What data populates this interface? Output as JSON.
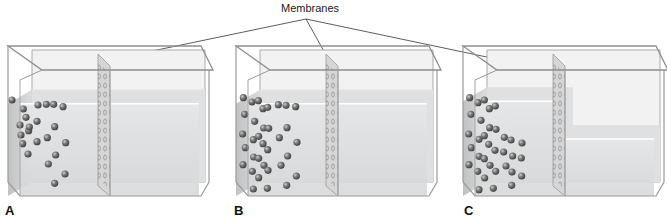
{
  "figure": {
    "callout_label": "Membranes",
    "panels": [
      {
        "label": "A",
        "description": "Equal solute concentration on both sides; equal water levels",
        "left_level": 0.78,
        "right_level": 0.78,
        "left_particles": [
          [
            24,
            180
          ],
          [
            58,
            207
          ],
          [
            66,
            232
          ],
          [
            48,
            255
          ],
          [
            74,
            272
          ],
          [
            51,
            285
          ],
          [
            102,
            195
          ],
          [
            99,
            244
          ],
          [
            76,
            261
          ],
          [
            99,
            305
          ],
          [
            56,
            311
          ],
          [
            72,
            342
          ]
        ],
        "right_particles": [
          [
            127,
            193
          ],
          [
            149,
            193
          ],
          [
            177,
            200
          ],
          [
            152,
            260
          ],
          [
            130,
            293
          ],
          [
            185,
            308
          ],
          [
            155,
            345
          ],
          [
            133,
            372
          ],
          [
            183,
            402
          ],
          [
            152,
            430
          ]
        ]
      },
      {
        "label": "B",
        "description": "Higher solute concentration on left; equal water levels",
        "left_particles": [
          [
            34,
            173
          ],
          [
            38,
            223
          ],
          [
            32,
            282
          ],
          [
            40,
            323
          ],
          [
            33,
            374
          ],
          [
            60,
            186
          ],
          [
            68,
            244
          ],
          [
            64,
            299
          ],
          [
            65,
            351
          ],
          [
            61,
            394
          ],
          [
            79,
            182
          ],
          [
            80,
            289
          ],
          [
            80,
            355
          ],
          [
            64,
            447
          ],
          [
            93,
            206
          ],
          [
            95,
            264
          ],
          [
            93,
            311
          ],
          [
            96,
            376
          ],
          [
            80,
            413
          ],
          [
            107,
            202
          ],
          [
            110,
            265
          ],
          [
            107,
            329
          ],
          [
            108,
            391
          ],
          [
            106,
            445
          ]
        ],
        "right_particles": [
          [
            139,
            194
          ],
          [
            162,
            196
          ],
          [
            191,
            200
          ],
          [
            165,
            263
          ],
          [
            142,
            293
          ],
          [
            195,
            307
          ],
          [
            167,
            348
          ],
          [
            147,
            376
          ],
          [
            193,
            408
          ],
          [
            164,
            436
          ]
        ],
        "left_level": 0.78,
        "right_level": 0.78
      },
      {
        "label": "C",
        "description": "Higher solute concentration on left; water moved by osmosis, left level higher",
        "left_particles": [
          [
            38,
            173
          ],
          [
            42,
            223
          ],
          [
            35,
            282
          ],
          [
            43,
            323
          ],
          [
            36,
            374
          ],
          [
            63,
            188
          ],
          [
            72,
            241
          ],
          [
            66,
            298
          ],
          [
            66,
            349
          ],
          [
            62,
            394
          ],
          [
            82,
            180
          ],
          [
            82,
            287
          ],
          [
            82,
            356
          ],
          [
            66,
            449
          ],
          [
            97,
            206
          ],
          [
            98,
            263
          ],
          [
            95,
            313
          ],
          [
            99,
            376
          ],
          [
            83,
            414
          ],
          [
            115,
            198
          ],
          [
            117,
            268
          ],
          [
            114,
            331
          ],
          [
            116,
            394
          ],
          [
            109,
            445
          ]
        ],
        "right_particles": [
          [
            142,
            292
          ],
          [
            162,
            300
          ],
          [
            195,
            309
          ],
          [
            140,
            336
          ],
          [
            167,
            348
          ],
          [
            147,
            378
          ],
          [
            193,
            354
          ],
          [
            165,
            396
          ],
          [
            194,
            408
          ],
          [
            164,
            436
          ]
        ],
        "left_level": 0.8,
        "right_level": 0.5
      }
    ],
    "colors": {
      "glass_edge": "#9a9a9a",
      "glass_fill": "#e9e9e9",
      "water": "#d7d9da",
      "water_side": "#c3c5c6",
      "particle": "#6b6b6b",
      "particle_highlight": "#bdbdbd",
      "membrane": "#c8c8c8",
      "membrane_dot": "#8a8a8a",
      "text": "#111111"
    }
  }
}
